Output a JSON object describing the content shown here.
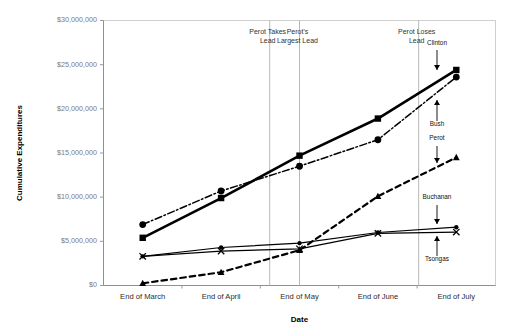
{
  "chart_data": {
    "type": "line",
    "title": "",
    "xlabel": "Date",
    "ylabel": "Cumulative Expenditures",
    "categories": [
      "End of March",
      "End of April",
      "End of May",
      "End of June",
      "End of July"
    ],
    "ylim": [
      0,
      30000000
    ],
    "ytick_values": [
      0,
      5000000,
      10000000,
      15000000,
      20000000,
      25000000,
      30000000
    ],
    "ytick_labels": [
      "$0",
      "$5,000,000",
      "$10,000,000",
      "$15,000,000",
      "$20,000,000",
      "$25,000,000",
      "$30,000,000"
    ],
    "grid": false,
    "legend_position": "inline-right-labels",
    "series": [
      {
        "name": "Clinton",
        "marker": "square",
        "line_style": "solid-thick",
        "values": [
          5400000,
          9900000,
          14700000,
          18900000,
          24400000
        ]
      },
      {
        "name": "Bush",
        "marker": "circle",
        "line_style": "dash-dot",
        "values": [
          6900000,
          10700000,
          13500000,
          16500000,
          23600000
        ]
      },
      {
        "name": "Perot",
        "marker": "triangle",
        "line_style": "dashed-thick",
        "values": [
          250000,
          1500000,
          4000000,
          10100000,
          14500000
        ]
      },
      {
        "name": "Buchanan",
        "marker": "circle-small",
        "line_style": "solid-thin",
        "values": [
          3300000,
          4300000,
          4800000,
          6000000,
          6600000
        ]
      },
      {
        "name": "Tsongas",
        "marker": "x",
        "line_style": "solid-thin",
        "values": [
          3300000,
          3900000,
          4150000,
          5900000,
          6050000
        ]
      }
    ],
    "annotations": [
      {
        "text_line1": "Perot Takes",
        "text_line2": "Lead",
        "at_category": "End of April",
        "offset_x": 0.62
      },
      {
        "text_line1": "Perot's",
        "text_line2": "Largest Lead",
        "at_category": "End of May",
        "offset_x": 0.0
      },
      {
        "text_line1": "Perot Loses",
        "text_line2": "Lead",
        "at_category": "End of June",
        "offset_x": 0.52
      }
    ],
    "series_callouts": [
      {
        "label": "Clinton",
        "arrow": "down"
      },
      {
        "label": "Bush",
        "arrow": "up"
      },
      {
        "label": "Perot",
        "arrow": "down"
      },
      {
        "label": "Buchanan",
        "arrow": "down"
      },
      {
        "label": "Tsongas",
        "arrow": "up"
      }
    ]
  }
}
